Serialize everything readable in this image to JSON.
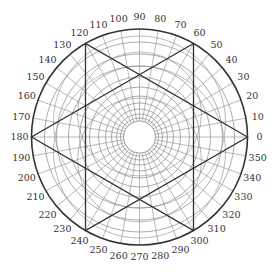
{
  "diagram": {
    "type": "polar-grid-with-hexagram",
    "center": [
      139.5,
      137
    ],
    "outer_radius": 108,
    "inner_radius": 16,
    "colors": {
      "grid": "#8a8a8a",
      "outline": "#333333",
      "labels": "#333333",
      "eccentric": "#a8a8a8"
    },
    "concentric_radii": [
      16,
      19,
      23,
      28,
      34,
      41,
      50,
      60,
      71,
      83,
      95,
      108
    ],
    "eccentric_circles": [
      {
        "cx": 139.5,
        "cy": 152,
        "r": 86
      },
      {
        "cx": 139.5,
        "cy": 122,
        "r": 86
      },
      {
        "cx": 139.5,
        "cy": 160,
        "r": 62
      },
      {
        "cx": 139.5,
        "cy": 114,
        "r": 62
      }
    ],
    "spoke_step_deg": 10,
    "angle_labels": [
      "0",
      "10",
      "20",
      "30",
      "40",
      "50",
      "60",
      "70",
      "80",
      "90",
      "100",
      "110",
      "120",
      "130",
      "140",
      "150",
      "160",
      "170",
      "180",
      "190",
      "200",
      "210",
      "220",
      "230",
      "240",
      "250",
      "260",
      "270",
      "280",
      "290",
      "300",
      "310",
      "320",
      "330",
      "340",
      "350"
    ],
    "label_offset": 12,
    "hexagram": {
      "triangle_a_deg": [
        0,
        120,
        240
      ],
      "triangle_b_deg": [
        60,
        180,
        300
      ]
    }
  }
}
